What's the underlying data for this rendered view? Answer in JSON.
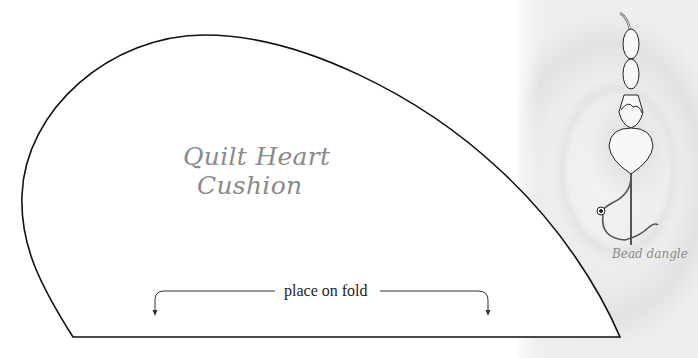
{
  "pattern": {
    "title_line1": "Quilt Heart",
    "title_line2": "Cushion",
    "fold_label": "place on fold",
    "outline_color": "#111111",
    "title_color": "#8a8a8a"
  },
  "illustration": {
    "caption": "Bead dangle",
    "caption_color": "#8a8a8a",
    "background": "rose-photo-grayscale"
  }
}
